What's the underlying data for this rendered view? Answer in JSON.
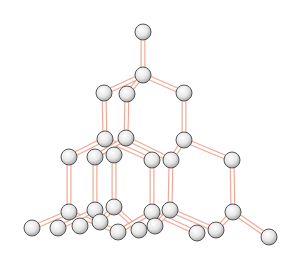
{
  "diagram": {
    "colors": {
      "bond_outer": "#f0a896",
      "bond_inner": "#ffffff",
      "atom_fill_light": "#ffffff",
      "atom_fill_dark": "#b8b8b8",
      "atom_stroke": "#555555"
    },
    "atom_radius": 8,
    "atoms": [
      [
        143,
        32
      ],
      [
        143,
        75
      ],
      [
        104,
        93
      ],
      [
        127,
        94
      ],
      [
        184,
        93
      ],
      [
        105,
        139
      ],
      [
        126,
        138
      ],
      [
        184,
        140
      ],
      [
        69,
        157
      ],
      [
        95,
        157
      ],
      [
        114,
        155
      ],
      [
        152,
        160
      ],
      [
        171,
        160
      ],
      [
        232,
        160
      ],
      [
        69,
        212
      ],
      [
        95,
        210
      ],
      [
        114,
        207
      ],
      [
        152,
        212
      ],
      [
        170,
        210
      ],
      [
        233,
        212
      ],
      [
        32,
        228
      ],
      [
        58,
        228
      ],
      [
        80,
        226
      ],
      [
        100,
        222
      ],
      [
        118,
        232
      ],
      [
        139,
        230
      ],
      [
        155,
        226
      ],
      [
        197,
        233
      ],
      [
        216,
        230
      ],
      [
        269,
        237
      ]
    ],
    "bonds": [
      [
        0,
        1
      ],
      [
        1,
        2
      ],
      [
        1,
        3
      ],
      [
        1,
        4
      ],
      [
        2,
        5
      ],
      [
        3,
        6
      ],
      [
        4,
        7
      ],
      [
        5,
        8
      ],
      [
        5,
        10
      ],
      [
        5,
        11
      ],
      [
        6,
        9
      ],
      [
        6,
        12
      ],
      [
        7,
        12
      ],
      [
        7,
        13
      ],
      [
        8,
        14
      ],
      [
        9,
        15
      ],
      [
        10,
        16
      ],
      [
        11,
        17
      ],
      [
        12,
        18
      ],
      [
        13,
        19
      ],
      [
        14,
        20
      ],
      [
        14,
        22
      ],
      [
        14,
        24
      ],
      [
        15,
        21
      ],
      [
        15,
        23
      ],
      [
        16,
        25
      ],
      [
        16,
        23
      ],
      [
        17,
        24
      ],
      [
        17,
        27
      ],
      [
        18,
        26
      ],
      [
        18,
        28
      ],
      [
        19,
        28
      ],
      [
        19,
        29
      ]
    ]
  }
}
